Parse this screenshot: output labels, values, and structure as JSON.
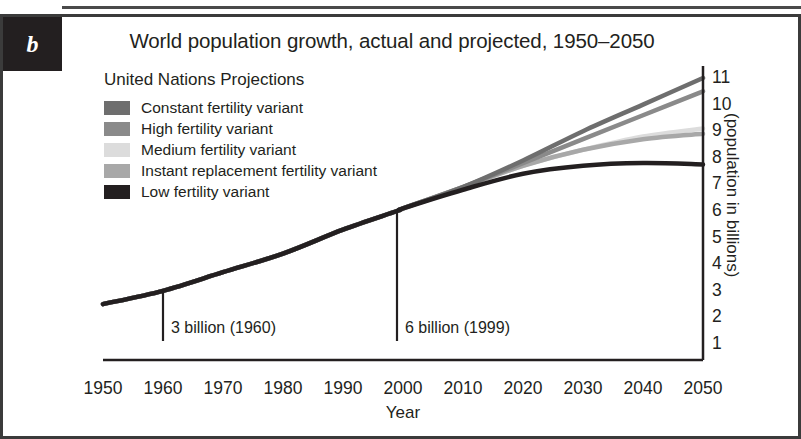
{
  "panel": {
    "letter": "b"
  },
  "chart_data": {
    "type": "line",
    "title": "World population growth, actual and projected, 1950–2050",
    "xlabel": "Year",
    "ylabel": "(population in billions)",
    "xlim": [
      1950,
      2050
    ],
    "ylim": [
      1,
      11
    ],
    "grid": false,
    "legend_position": "upper-left",
    "legend_title": "United Nations Projections",
    "xticks": [
      1950,
      1960,
      1970,
      1980,
      1990,
      2000,
      2010,
      2020,
      2030,
      2040,
      2050
    ],
    "yticks": [
      1,
      2,
      3,
      4,
      5,
      6,
      7,
      8,
      9,
      10,
      11
    ],
    "series": [
      {
        "name": "Constant fertility variant",
        "color": "#6e6e6e",
        "x": [
          1950,
          1960,
          1970,
          1980,
          1990,
          1999,
          2000,
          2010,
          2020,
          2030,
          2040,
          2050
        ],
        "values": [
          2.5,
          3.0,
          3.7,
          4.4,
          5.3,
          6.0,
          6.1,
          6.9,
          7.9,
          9.0,
          10.0,
          11.0
        ]
      },
      {
        "name": "High fertility variant",
        "color": "#8a8a8a",
        "x": [
          1950,
          1960,
          1970,
          1980,
          1990,
          1999,
          2000,
          2010,
          2020,
          2030,
          2040,
          2050
        ],
        "values": [
          2.5,
          3.0,
          3.7,
          4.4,
          5.3,
          6.0,
          6.1,
          6.9,
          7.8,
          8.7,
          9.6,
          10.5
        ]
      },
      {
        "name": "Medium fertility variant",
        "color": "#dcdcdc",
        "x": [
          1950,
          1960,
          1970,
          1980,
          1990,
          1999,
          2000,
          2010,
          2020,
          2030,
          2040,
          2050
        ],
        "values": [
          2.5,
          3.0,
          3.7,
          4.4,
          5.3,
          6.0,
          6.1,
          6.9,
          7.7,
          8.3,
          8.8,
          9.1
        ]
      },
      {
        "name": "Instant replacement fertility variant",
        "color": "#a8a8a8",
        "x": [
          1950,
          1960,
          1970,
          1980,
          1990,
          1999,
          2000,
          2010,
          2020,
          2030,
          2040,
          2050
        ],
        "values": [
          2.5,
          3.0,
          3.7,
          4.4,
          5.3,
          6.0,
          6.1,
          6.9,
          7.7,
          8.3,
          8.7,
          8.9
        ]
      },
      {
        "name": "Low fertility variant",
        "color": "#231f20",
        "x": [
          1950,
          1960,
          1970,
          1980,
          1990,
          1999,
          2000,
          2010,
          2020,
          2030,
          2040,
          2050
        ],
        "values": [
          2.5,
          3.0,
          3.7,
          4.4,
          5.3,
          6.0,
          6.1,
          6.8,
          7.4,
          7.7,
          7.8,
          7.75
        ]
      }
    ],
    "historical": {
      "name": "Actual population",
      "color": "#e0e0e0",
      "x": [
        1950,
        1960,
        1970,
        1980,
        1990,
        1999,
        2010
      ],
      "values": [
        2.5,
        3.0,
        3.7,
        4.4,
        5.3,
        6.0,
        6.9
      ]
    },
    "annotations": [
      {
        "label": "3 billion (1960)",
        "year": 1960,
        "value": 3
      },
      {
        "label": "6 billion (1999)",
        "year": 1999,
        "value": 6
      }
    ]
  }
}
